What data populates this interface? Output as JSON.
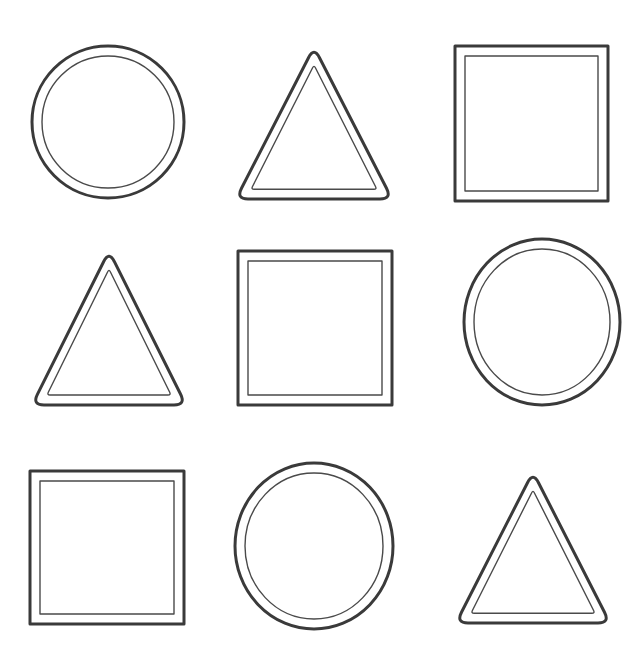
{
  "worksheet": {
    "background": "#ffffff",
    "outline_color": "#3a3a3a",
    "rows": 3,
    "columns": 3,
    "shapes": [
      {
        "row": 1,
        "col": 1,
        "type": "circle",
        "cx": 108,
        "cy": 122,
        "rx": 76,
        "ry": 76
      },
      {
        "row": 1,
        "col": 2,
        "type": "triangle",
        "apex": [
          314,
          47
        ],
        "left": [
          236,
          199
        ],
        "right": [
          392,
          199
        ]
      },
      {
        "row": 1,
        "col": 3,
        "type": "square",
        "x": 455,
        "y": 46,
        "w": 153,
        "h": 155
      },
      {
        "row": 2,
        "col": 1,
        "type": "triangle",
        "apex": [
          109,
          251
        ],
        "left": [
          32,
          405
        ],
        "right": [
          186,
          405
        ]
      },
      {
        "row": 2,
        "col": 2,
        "type": "square",
        "x": 238,
        "y": 251,
        "w": 154,
        "h": 154
      },
      {
        "row": 2,
        "col": 3,
        "type": "circle",
        "cx": 542,
        "cy": 322,
        "rx": 78,
        "ry": 83
      },
      {
        "row": 3,
        "col": 1,
        "type": "square",
        "x": 30,
        "y": 471,
        "w": 154,
        "h": 153
      },
      {
        "row": 3,
        "col": 2,
        "type": "circle",
        "cx": 314,
        "cy": 546,
        "rx": 79,
        "ry": 83
      },
      {
        "row": 3,
        "col": 3,
        "type": "triangle",
        "apex": [
          533,
          472
        ],
        "left": [
          456,
          623
        ],
        "right": [
          610,
          623
        ]
      }
    ]
  }
}
